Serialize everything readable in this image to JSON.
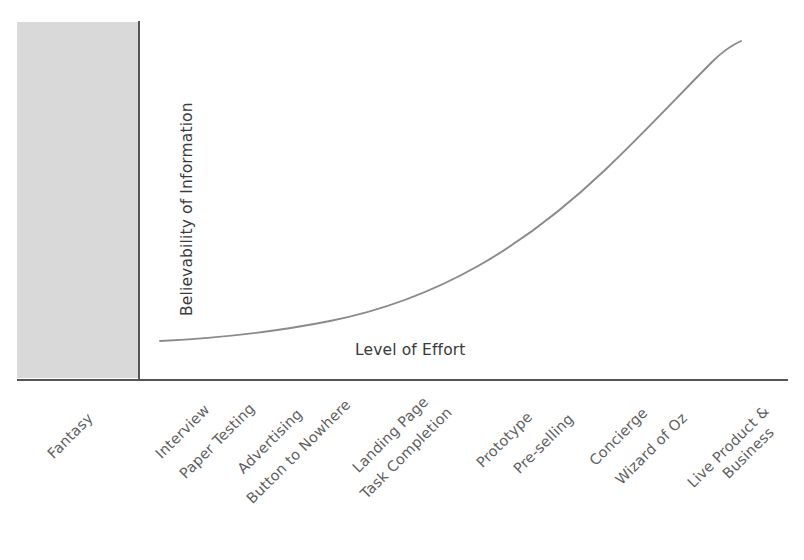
{
  "chart_data": {
    "type": "line",
    "title": "",
    "xlabel": "Level of Effort",
    "ylabel": "Believability of Information",
    "grid": false,
    "legend": false,
    "axis_ranges": {
      "x": [
        0,
        13
      ],
      "y": [
        0,
        10
      ]
    },
    "categories": [
      "Fantasy",
      "Interview",
      "Paper Testing",
      "Advertising",
      "Button to Nowhere",
      "Landing Page",
      "Task Completion",
      "Prototype",
      "Pre-selling",
      "Concierge",
      "Wizard of Oz",
      "Live Product &",
      "Business"
    ],
    "series": [
      {
        "name": "Believability vs Effort",
        "x": [
          1,
          2,
          3,
          4,
          5,
          6,
          7,
          8,
          9,
          10,
          11,
          12
        ],
        "values": [
          0.6,
          0.8,
          1.1,
          1.5,
          2.1,
          2.8,
          3.7,
          4.8,
          6.1,
          7.4,
          8.7,
          9.8
        ]
      }
    ],
    "annotations": [
      {
        "name": "fantasy-zone",
        "label": "Fantasy",
        "description": "Shaded region left of the vertical axis covering the Fantasy category",
        "color": "#d6d6d6"
      }
    ],
    "colors": {
      "curve": "#8a8a8a",
      "axis": "#555555",
      "zone_fill": "#d6d6d6",
      "axis_title_text": "#3a3a3a",
      "tick_text": "#5e5e5e",
      "background": "#ffffff"
    }
  },
  "axes": {
    "y_title": "Believability of Information",
    "x_title": "Level of Effort"
  },
  "ticks": [
    {
      "label": "Fantasy",
      "x": 50,
      "y": 448
    },
    {
      "label": "Interview",
      "x": 158,
      "y": 448
    },
    {
      "label": "Paper Testing",
      "x": 182,
      "y": 468
    },
    {
      "label": "Advertising",
      "x": 240,
      "y": 463
    },
    {
      "label": "Button to Nowhere",
      "x": 249,
      "y": 493
    },
    {
      "label": "Landing Page",
      "x": 355,
      "y": 462
    },
    {
      "label": "Task Completion",
      "x": 363,
      "y": 488
    },
    {
      "label": "Prototype",
      "x": 479,
      "y": 457
    },
    {
      "label": "Pre-selling",
      "x": 516,
      "y": 463
    },
    {
      "label": "Concierge",
      "x": 592,
      "y": 455
    },
    {
      "label": "Wizard of Oz",
      "x": 618,
      "y": 474
    },
    {
      "label": "Live Product &",
      "x": 690,
      "y": 477
    },
    {
      "label": "Business",
      "x": 725,
      "y": 468
    }
  ]
}
